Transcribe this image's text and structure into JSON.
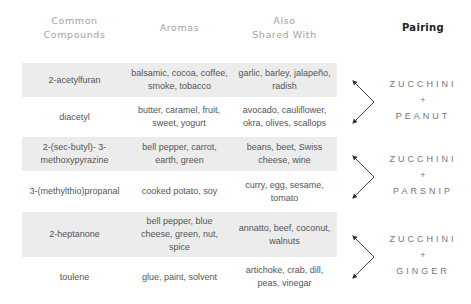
{
  "headers": {
    "compounds": "Common\nCompounds",
    "compounds_l1": "Common",
    "compounds_l2": "Compounds",
    "aromas": "Aromas",
    "shared_l1": "Also",
    "shared_l2": "Shared With",
    "pairing": "Pairing"
  },
  "rows": [
    {
      "compound": "2-acetylfuran",
      "aromas": "balsamic, cocoa, coffee, smoke, tobacco",
      "shared": "garlic, barley, jalapeño, radish"
    },
    {
      "compound": "diacetyl",
      "aromas": "butter, caramel, fruit, sweet, yogurt",
      "shared": "avocado, cauliflower, okra, olives, scallops"
    },
    {
      "compound": "2-(sec-butyl)- 3-methoxypyrazine",
      "aromas": "bell pepper, carrot, earth, green",
      "shared": "beans, beet, Swiss cheese, wine"
    },
    {
      "compound": "3-(methylthio)propanal",
      "aromas": "cooked potato, soy",
      "shared": "curry, egg, sesame, tomato"
    },
    {
      "compound": "2-heptanone",
      "aromas": "bell pepper, blue cheese, green, nut, spice",
      "shared": "annatto, beef, coconut, walnuts"
    },
    {
      "compound": "toulene",
      "aromas": "glue, paint, solvent",
      "shared": "artichoke, crab, dill, peas, vinegar"
    }
  ],
  "pairings": [
    {
      "first": "ZUCCHINI",
      "plus": "+",
      "second": "PEANUT"
    },
    {
      "first": "ZUCCHINI",
      "plus": "+",
      "second": "PARSNIP"
    },
    {
      "first": "ZUCCHINI",
      "plus": "+",
      "second": "GINGER"
    }
  ],
  "colors": {
    "band": "#ececec",
    "header": "#a3a3a3",
    "pairing_header": "#222222",
    "text": "#555555"
  }
}
